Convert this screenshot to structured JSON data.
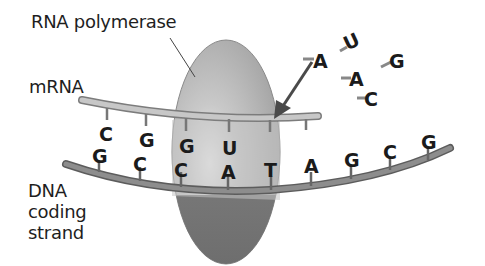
{
  "labels": {
    "polymerase": "RNA polymerase",
    "mrna": "mRNA",
    "dna_line1": "DNA",
    "dna_line2": "coding",
    "dna_line3": "strand"
  },
  "mrna_bases": [
    "C",
    "G",
    "G",
    "U"
  ],
  "dna_bases": [
    "G",
    "C",
    "C",
    "A",
    "T",
    "A",
    "G",
    "C",
    "G"
  ],
  "free_nucleotides": [
    "A",
    "U",
    "G",
    "A",
    "C"
  ],
  "colors": {
    "polymerase_top": "#b5b5b5",
    "polymerase_bottom": "#7d7d7d",
    "strand": "#8a8a8a",
    "mrna_strand": "#b8b8b8",
    "arrow": "#4a4a4a",
    "text": "#1e1e1e"
  }
}
